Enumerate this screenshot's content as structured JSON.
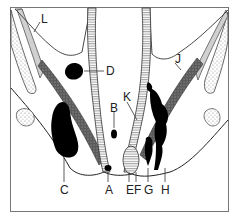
{
  "diagram": {
    "type": "anatomical cross-section",
    "labels": [
      {
        "id": "A",
        "text": "A",
        "x": 105,
        "y": 184
      },
      {
        "id": "B",
        "text": "B",
        "x": 110,
        "y": 102
      },
      {
        "id": "C",
        "text": "C",
        "x": 61,
        "y": 184
      },
      {
        "id": "D",
        "text": "D",
        "x": 105,
        "y": 65
      },
      {
        "id": "E",
        "text": "E",
        "x": 127,
        "y": 184
      },
      {
        "id": "F",
        "text": "F",
        "x": 135,
        "y": 184
      },
      {
        "id": "G",
        "text": "G",
        "x": 145,
        "y": 184
      },
      {
        "id": "H",
        "text": "H",
        "x": 162,
        "y": 184
      },
      {
        "id": "J",
        "text": "J",
        "x": 174,
        "y": 53
      },
      {
        "id": "K",
        "text": "K",
        "x": 124,
        "y": 90
      },
      {
        "id": "L",
        "text": "L",
        "x": 40,
        "y": 14
      }
    ],
    "colors": {
      "ink": "#111111",
      "line": "#333333",
      "frame": "#555555",
      "muscle_fill": "#6d6d6d",
      "bone_stipple": "#bcbcbc",
      "levator_fill": "#d4d4d4",
      "background": "#ffffff"
    }
  }
}
